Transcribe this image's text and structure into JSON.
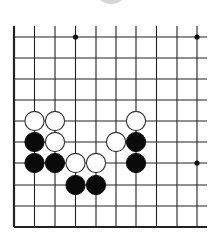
{
  "board": {
    "columns_x": [
      14,
      34.5,
      55,
      75.5,
      96,
      116,
      136,
      156.5,
      177,
      197
    ],
    "rows_y": [
      37,
      58,
      79,
      100,
      121,
      142,
      163,
      185,
      206,
      227
    ],
    "left_edge": true,
    "bottom_edge": true,
    "top_open_to_y": 26,
    "right_open_to_x": 207,
    "line_color": "#222222",
    "star_points": [
      {
        "col": 3,
        "row": 0
      },
      {
        "col": 9,
        "row": 0
      },
      {
        "col": 9,
        "row": 6
      }
    ],
    "stones": [
      {
        "color": "white",
        "col": 1,
        "row": 4
      },
      {
        "color": "white",
        "col": 2,
        "row": 4
      },
      {
        "color": "white",
        "col": 6,
        "row": 4
      },
      {
        "color": "black",
        "col": 1,
        "row": 5
      },
      {
        "color": "white",
        "col": 2,
        "row": 5
      },
      {
        "color": "white",
        "col": 5,
        "row": 5
      },
      {
        "color": "black",
        "col": 6,
        "row": 5
      },
      {
        "color": "black",
        "col": 1,
        "row": 6
      },
      {
        "color": "black",
        "col": 2,
        "row": 6
      },
      {
        "color": "white",
        "col": 3,
        "row": 6
      },
      {
        "color": "white",
        "col": 4,
        "row": 6
      },
      {
        "color": "black",
        "col": 6,
        "row": 6
      },
      {
        "color": "black",
        "col": 3,
        "row": 7
      },
      {
        "color": "black",
        "col": 4,
        "row": 7
      }
    ],
    "stone_radius": 9.6
  }
}
